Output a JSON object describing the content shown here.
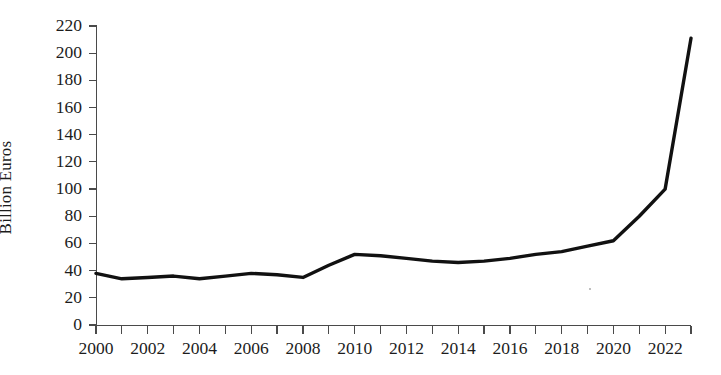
{
  "chart_data": {
    "type": "line",
    "title": "",
    "xlabel": "",
    "ylabel": "Billion Euros",
    "x": [
      2000,
      2001,
      2002,
      2003,
      2004,
      2005,
      2006,
      2007,
      2008,
      2009,
      2010,
      2011,
      2012,
      2013,
      2014,
      2015,
      2016,
      2017,
      2018,
      2019,
      2020,
      2021,
      2022,
      2023
    ],
    "values": [
      38,
      34,
      35,
      36,
      34,
      36,
      38,
      37,
      35,
      44,
      52,
      51,
      49,
      47,
      46,
      47,
      49,
      52,
      54,
      58,
      62,
      80,
      100,
      211
    ],
    "xlim": [
      2000,
      2023
    ],
    "ylim": [
      0,
      220
    ],
    "y_ticks": [
      0,
      20,
      40,
      60,
      80,
      100,
      120,
      140,
      160,
      180,
      200,
      220
    ],
    "y_tick_labels": [
      "0",
      "20",
      "40",
      "60",
      "80",
      "100",
      "120",
      "140",
      "160",
      "180",
      "200",
      "220"
    ],
    "x_ticks": [
      2000,
      2001,
      2002,
      2003,
      2004,
      2005,
      2006,
      2007,
      2008,
      2009,
      2010,
      2011,
      2012,
      2013,
      2014,
      2015,
      2016,
      2017,
      2018,
      2019,
      2020,
      2021,
      2022,
      2023
    ],
    "x_tick_labels": [
      "2000",
      "",
      "2002",
      "",
      "2004",
      "",
      "2006",
      "",
      "2008",
      "",
      "2010",
      "",
      "2012",
      "",
      "2014",
      "",
      "2016",
      "",
      "2018",
      "",
      "2020",
      "",
      "2022",
      ""
    ],
    "grid": false,
    "legend": false,
    "legend_position": "none",
    "series": [
      {
        "name": "Billion Euros",
        "color": "#111111",
        "values": [
          38,
          34,
          35,
          36,
          34,
          36,
          38,
          37,
          35,
          44,
          52,
          51,
          49,
          47,
          46,
          47,
          49,
          52,
          54,
          58,
          62,
          80,
          100,
          211
        ]
      }
    ],
    "colors": {
      "line": "#111111",
      "axis": "#4a4a4a",
      "text": "#1c1c1c",
      "background": "#ffffff"
    }
  }
}
